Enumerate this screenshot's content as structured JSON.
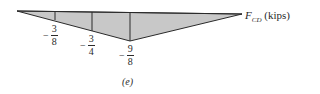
{
  "diagram": {
    "type": "influence_line",
    "axis_label": {
      "symbol": "F",
      "subscript": "CD",
      "units": "(kips)"
    },
    "caption": "(e)",
    "fill_color": "#c8c8c8",
    "stroke_color": "#2a2a2a",
    "ordinates": [
      {
        "sign": "−",
        "numerator": "3",
        "denominator": "8",
        "value": -0.375
      },
      {
        "sign": "−",
        "numerator": "3",
        "denominator": "4",
        "value": -0.75
      },
      {
        "sign": "−",
        "numerator": "9",
        "denominator": "8",
        "value": -1.125
      }
    ]
  }
}
